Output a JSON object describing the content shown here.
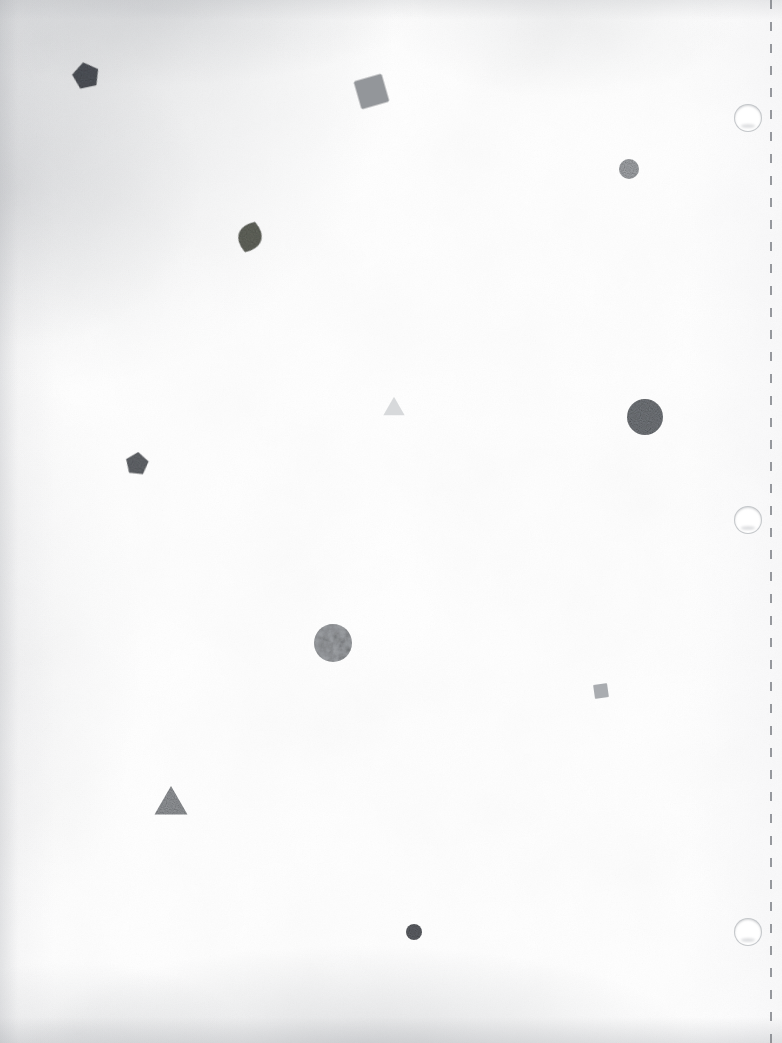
{
  "page": {
    "width": 782,
    "height": 1043,
    "background_color": "#fefefe",
    "paper_tone": "#fdfdfd",
    "media": "perforated binder sheet, three-hole punched, right margin"
  },
  "margin": {
    "perforation": {
      "name": "perforation-line",
      "x": 770,
      "dash_color": "#7d8086",
      "dash_length": 9,
      "dash_gap": 13,
      "width": 2
    },
    "punch_holes": [
      {
        "label": "punch-hole-top",
        "cx": 748,
        "cy": 118,
        "r": 13,
        "ring_color": "#b2b5ba"
      },
      {
        "label": "punch-hole-middle",
        "cx": 748,
        "cy": 520,
        "r": 13,
        "ring_color": "#b2b5ba"
      },
      {
        "label": "punch-hole-bottom",
        "cx": 748,
        "cy": 932,
        "r": 13,
        "ring_color": "#b2b5ba"
      }
    ]
  },
  "shapes": [
    {
      "id": "pentagon-dark-top-left",
      "kind": "pentagon",
      "cx": 86,
      "cy": 76,
      "size": 26,
      "rotation": -12,
      "fill": "#4a4e55",
      "opacity": 0.95,
      "texture": "grainy"
    },
    {
      "id": "square-gray-top-center",
      "kind": "square",
      "cx": 371,
      "cy": 91,
      "size": 29,
      "rotation": -16,
      "fill": "#8b8e92",
      "opacity": 0.92,
      "texture": "smooth"
    },
    {
      "id": "circle-small-gray-upper-right",
      "kind": "circle",
      "cx": 629,
      "cy": 169,
      "size": 20,
      "rotation": 0,
      "fill": "#9ea1a5",
      "opacity": 0.95,
      "texture": "grainy"
    },
    {
      "id": "leaf-olive-upper-left",
      "kind": "leaf",
      "cx": 250,
      "cy": 237,
      "size": 32,
      "rotation": 18,
      "fill": "#5d6057",
      "opacity": 0.95,
      "texture": "grainy"
    },
    {
      "id": "triangle-pale-center",
      "kind": "triangle",
      "cx": 394,
      "cy": 409,
      "size": 22,
      "rotation": 0,
      "fill": "#d6d8da",
      "opacity": 0.95,
      "texture": "smooth"
    },
    {
      "id": "circle-large-gray-right",
      "kind": "circle",
      "cx": 645,
      "cy": 417,
      "size": 36,
      "rotation": 0,
      "fill": "#6e7277",
      "opacity": 0.96,
      "texture": "grainy"
    },
    {
      "id": "pentagon-gray-mid-left",
      "kind": "pentagon",
      "cx": 137,
      "cy": 464,
      "size": 22,
      "rotation": 6,
      "fill": "#5e6166",
      "opacity": 0.95,
      "texture": "grainy"
    },
    {
      "id": "circle-textured-center",
      "kind": "circle",
      "cx": 333,
      "cy": 643,
      "size": 38,
      "rotation": 0,
      "fill": "#9a9da1",
      "opacity": 0.95,
      "texture": "noisy"
    },
    {
      "id": "square-small-gray-right",
      "kind": "square",
      "cx": 601,
      "cy": 691,
      "size": 14,
      "rotation": -8,
      "fill": "#a3a6aa",
      "opacity": 0.92,
      "texture": "smooth"
    },
    {
      "id": "triangle-gray-lower-left",
      "kind": "triangle",
      "cx": 171,
      "cy": 805,
      "size": 34,
      "rotation": 0,
      "fill": "#8e9195",
      "opacity": 0.95,
      "texture": "grainy"
    },
    {
      "id": "circle-dot-dark-bottom",
      "kind": "circle",
      "cx": 414,
      "cy": 932,
      "size": 16,
      "rotation": 0,
      "fill": "#55585e",
      "opacity": 0.95,
      "texture": "grainy"
    }
  ],
  "palette": {
    "darkest": "#4a4e55",
    "dark": "#55585e",
    "mid_dark": "#5e6166",
    "olive": "#5d6057",
    "mid": "#6e7277",
    "gray": "#8b8e92",
    "light_gray": "#9ea1a5",
    "pale": "#d6d8da",
    "paper": "#fefefe",
    "vignette": "#a0a3a8"
  }
}
